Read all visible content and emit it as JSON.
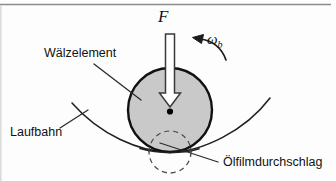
{
  "figure": {
    "title_internal": "Waelzelement-Laufbahn-Kontakt",
    "background_color": "#fdfdfd",
    "border_color": "#8d8d8d",
    "labels": {
      "rolling_element": "Wälzelement",
      "raceway": "Laufbahn",
      "oil_film_breakdown": "Ölfilmdurchschlag",
      "force": "F",
      "angular_velocity_symbol": "ω",
      "angular_velocity_subscript": "b"
    },
    "colors": {
      "body_fill": "#c9c9c9",
      "outline": "#1a1a1a",
      "leader_line": "#2b2b2b",
      "arrow_fill": "#ffffff",
      "dashed_circle": "#4a4a4a",
      "center_dot": "#000000"
    },
    "geometry": {
      "rolling_element_center_x": 170,
      "rolling_element_center_y": 110,
      "rolling_element_radius": 42,
      "contact_point_x": 170,
      "contact_point_y": 152,
      "dashed_circle_radius": 21,
      "force_arrow_from_y": 34,
      "force_arrow_to_y": 106
    }
  }
}
